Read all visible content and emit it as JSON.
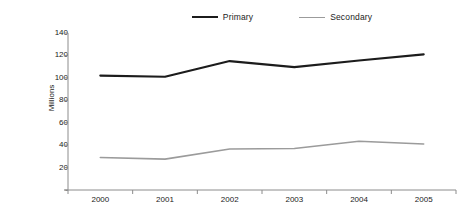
{
  "chart_data": {
    "type": "line",
    "title": "",
    "subtitle": "",
    "xlabel": "",
    "ylabel": "Millions",
    "categories": [
      "2000",
      "2001",
      "2002",
      "2003",
      "2004",
      "2005"
    ],
    "series": [
      {
        "name": "Primary",
        "color": "#1c1c1c",
        "values": [
          102,
          101,
          115,
          109.5,
          115.5,
          121
        ]
      },
      {
        "name": "Secondary",
        "color": "#9b9b9b",
        "values": [
          29,
          27.5,
          36.5,
          37,
          43.5,
          41
        ]
      }
    ],
    "ylim": [
      0,
      140
    ],
    "ytick_values": [
      0,
      20,
      40,
      60,
      80,
      100,
      120,
      140
    ],
    "ytick_labels": [
      "-",
      "20",
      "40",
      "60",
      "80",
      "100",
      "120",
      "140"
    ],
    "grid": false,
    "legend_position": "top",
    "background": "#ffffff",
    "axis_color": "#8c8c8c"
  },
  "legend": {
    "items": [
      {
        "label": "Primary"
      },
      {
        "label": "Secondary"
      }
    ]
  },
  "axes": {
    "y_label": "Millions"
  }
}
